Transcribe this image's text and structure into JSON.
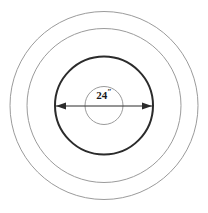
{
  "figure": {
    "background_color": "#ffffff",
    "width": 208,
    "height": 213,
    "center": {
      "x": 104,
      "y": 105.5
    }
  },
  "circles": [
    {
      "name": "outer-circle",
      "radius": 94,
      "stroke_color": "#9b9b9b",
      "stroke_width": 1,
      "emphasis": "thin"
    },
    {
      "name": "second-circle",
      "radius": 77,
      "stroke_color": "#9b9b9b",
      "stroke_width": 1,
      "emphasis": "thin"
    },
    {
      "name": "dimensioned-circle",
      "radius": 49,
      "stroke_color": "#2b2b2b",
      "stroke_width": 2,
      "emphasis": "bold"
    },
    {
      "name": "inner-circle",
      "radius": 19,
      "stroke_color": "#9b9b9b",
      "stroke_width": 1,
      "emphasis": "thin"
    }
  ],
  "dimension": {
    "name": "diameter-dimension",
    "label_value": "24",
    "label_unit": "″",
    "label_full": "24″",
    "orientation": "horizontal",
    "line_y": 106,
    "start_x": 55,
    "end_x": 153,
    "span_px": 98,
    "line_color": "#2b2b2b",
    "line_width": 1,
    "arrowheads": "both",
    "extension_ticks": true,
    "label_x": 104,
    "label_y": 99
  }
}
